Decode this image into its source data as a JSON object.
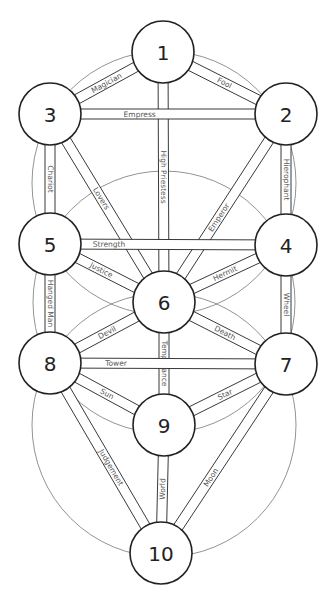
{
  "diagram": {
    "title": "",
    "stroke_color": "#222222",
    "thin_stroke_color": "#777777",
    "background": "#ffffff",
    "node_radius": 31,
    "band_half_width": 5,
    "background_circles": [
      {
        "cx": 164,
        "cy": 183,
        "r": 132
      },
      {
        "cx": 164,
        "cy": 302,
        "r": 131
      },
      {
        "cx": 164,
        "cy": 425,
        "r": 132
      }
    ],
    "nodes": [
      {
        "id": "1",
        "label": "1",
        "cx": 163,
        "cy": 52
      },
      {
        "id": "2",
        "label": "2",
        "cx": 286,
        "cy": 114
      },
      {
        "id": "3",
        "label": "3",
        "cx": 50,
        "cy": 114
      },
      {
        "id": "4",
        "label": "4",
        "cx": 286,
        "cy": 245
      },
      {
        "id": "5",
        "label": "5",
        "cx": 50,
        "cy": 244
      },
      {
        "id": "6",
        "label": "6",
        "cx": 164,
        "cy": 302
      },
      {
        "id": "7",
        "label": "7",
        "cx": 286,
        "cy": 364
      },
      {
        "id": "8",
        "label": "8",
        "cx": 50,
        "cy": 363
      },
      {
        "id": "9",
        "label": "9",
        "cx": 164,
        "cy": 425
      },
      {
        "id": "10",
        "label": "10",
        "cx": 161,
        "cy": 553
      }
    ],
    "paths": [
      {
        "from": "1",
        "to": "2",
        "label": "Fool"
      },
      {
        "from": "1",
        "to": "3",
        "label": "Magician"
      },
      {
        "from": "1",
        "to": "6",
        "label": "High Priestess"
      },
      {
        "from": "2",
        "to": "3",
        "label": "Empress"
      },
      {
        "from": "2",
        "to": "6",
        "label": "Emperor"
      },
      {
        "from": "2",
        "to": "4",
        "label": "Hierophant"
      },
      {
        "from": "3",
        "to": "6",
        "label": "Lovers"
      },
      {
        "from": "3",
        "to": "5",
        "label": "Chariot"
      },
      {
        "from": "4",
        "to": "5",
        "label": "Strength"
      },
      {
        "from": "4",
        "to": "6",
        "label": "Hermit"
      },
      {
        "from": "4",
        "to": "7",
        "label": "Wheel"
      },
      {
        "from": "5",
        "to": "6",
        "label": "Justice"
      },
      {
        "from": "5",
        "to": "8",
        "label": "Hanged Man"
      },
      {
        "from": "6",
        "to": "7",
        "label": "Death"
      },
      {
        "from": "6",
        "to": "8",
        "label": "Devil"
      },
      {
        "from": "6",
        "to": "9",
        "label": "Temperance"
      },
      {
        "from": "7",
        "to": "8",
        "label": "Tower"
      },
      {
        "from": "7",
        "to": "9",
        "label": "Star"
      },
      {
        "from": "8",
        "to": "9",
        "label": "Sun"
      },
      {
        "from": "7",
        "to": "10",
        "label": "Moon"
      },
      {
        "from": "8",
        "to": "10",
        "label": "Judgement"
      },
      {
        "from": "9",
        "to": "10",
        "label": "World"
      }
    ]
  }
}
